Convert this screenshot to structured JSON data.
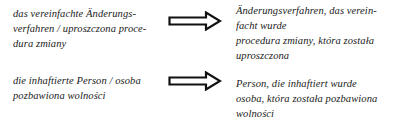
{
  "entries": [
    {
      "source_lines": [
        "das vereinfachte Änderungs-",
        "verfahren / uproszczona proce-",
        "dura zmiany"
      ],
      "arrow_icon": "double-outline-right-arrow",
      "target_lines": [
        "Änderungsverfahren, das verein-",
        "facht wurde",
        "procedura zmiany, która została",
        "uproszczona"
      ]
    },
    {
      "source_lines": [
        "die inhaftierte Person / osoba",
        "pozbawiona wolności"
      ],
      "arrow_icon": "double-outline-right-arrow",
      "target_lines": [
        "Person, die inhaftiert wurde",
        "osoba, która została pozbawiona",
        "wolności"
      ]
    }
  ],
  "colors": {
    "text": "#1a1a1a",
    "arrow_stroke": "#111111",
    "background": "#ffffff"
  }
}
